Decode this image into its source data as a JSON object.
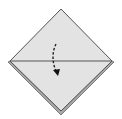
{
  "diagram": {
    "type": "origami-fold-step",
    "colors": {
      "background": "#ffffff",
      "paper_face": "#e3e3e3",
      "paper_edge_band": "#a8a8a8",
      "outline": "#555555",
      "crease": "#555555",
      "arrow": "#222222"
    },
    "shapes": {
      "diamond": {
        "top": [
          61,
          9
        ],
        "right": [
          112,
          61
        ],
        "bottom": [
          61,
          112
        ],
        "left": [
          10,
          61
        ]
      },
      "crease": {
        "from": [
          11,
          61
        ],
        "to": [
          111,
          61
        ]
      },
      "arrow": {
        "from": [
          56,
          44
        ],
        "to": [
          58,
          74
        ],
        "style": "dashed",
        "direction": "down"
      }
    }
  }
}
